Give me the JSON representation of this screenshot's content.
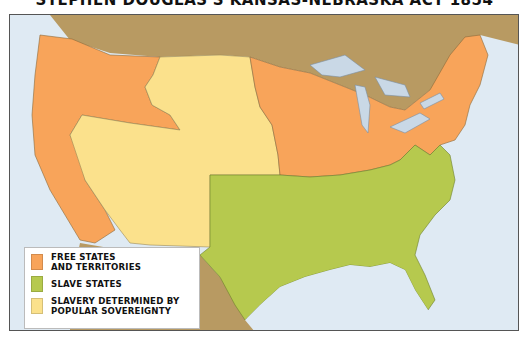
{
  "title": "STEPHEN DOUGLAS'S KANSAS-NEBRASKA ACT 1854",
  "colors": {
    "free": "#f8a45a",
    "slave": "#b6c94e",
    "popular_sovereignty": "#fbe18c",
    "foreign_land": "#b89a62",
    "water": "#dfeaf3",
    "border": "#555555"
  },
  "legend": {
    "items": [
      {
        "label_line1": "FREE STATES",
        "label_line2": "AND TERRITORIES",
        "color": "#f8a45a"
      },
      {
        "label_line1": "SLAVE STATES",
        "label_line2": "",
        "color": "#b6c94e"
      },
      {
        "label_line1": "SLAVERY DETERMINED BY",
        "label_line2": "POPULAR SOVEREIGNTY",
        "color": "#fbe18c"
      }
    ]
  },
  "regions": [
    {
      "name": "Pacific Northwest & California",
      "category": "free"
    },
    {
      "name": "Nebraska / Kansas / Utah / New Mexico Territories",
      "category": "popular_sovereignty"
    },
    {
      "name": "Midwest, Northeast",
      "category": "free"
    },
    {
      "name": "South (Texas to Florida, Virginia)",
      "category": "slave"
    },
    {
      "name": "Canada / Mexico",
      "category": "foreign_land"
    }
  ]
}
